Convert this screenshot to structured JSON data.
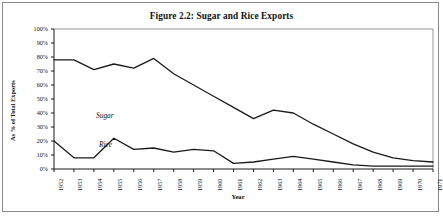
{
  "figure": {
    "title": "Figure 2.2:  Sugar and Rice Exports"
  },
  "axes": {
    "y_title": "As % of Total Exports",
    "x_title": "Year",
    "y_ticks": [
      "100%",
      "90%",
      "80%",
      "70%",
      "60%",
      "50%",
      "40%",
      "30%",
      "20%",
      "10%",
      "0%"
    ],
    "x_ticks": [
      "1952",
      "1953",
      "1954",
      "1955",
      "1956",
      "1957",
      "1958",
      "1959",
      "1960",
      "1961",
      "1962",
      "1963",
      "1964",
      "1965",
      "1966",
      "1967",
      "1968",
      "1969",
      "1970",
      "1971"
    ]
  },
  "series_labels": {
    "sugar": "Sugar",
    "rice": "Rice"
  },
  "chart_data": {
    "type": "line",
    "title": "Figure 2.2:  Sugar and Rice Exports",
    "xlabel": "Year",
    "ylabel": "As % of Total Exports",
    "xlim": [
      1952,
      1971
    ],
    "ylim": [
      0,
      100
    ],
    "grid": false,
    "legend": "inline-annotation",
    "x": [
      1952,
      1953,
      1954,
      1955,
      1956,
      1957,
      1958,
      1959,
      1960,
      1961,
      1962,
      1963,
      1964,
      1965,
      1966,
      1967,
      1968,
      1969,
      1970,
      1971
    ],
    "series": [
      {
        "name": "Sugar",
        "color": "#1a1a1a",
        "values": [
          78,
          78,
          71,
          75,
          72,
          79,
          68,
          60,
          52,
          44,
          36,
          42,
          40,
          32,
          25,
          18,
          12,
          8,
          6,
          5
        ]
      },
      {
        "name": "Rice",
        "color": "#1a1a1a",
        "values": [
          20,
          8,
          8,
          22,
          14,
          15,
          12,
          14,
          13,
          4,
          5,
          7,
          9,
          7,
          5,
          3,
          2,
          2,
          2,
          2
        ]
      }
    ]
  }
}
